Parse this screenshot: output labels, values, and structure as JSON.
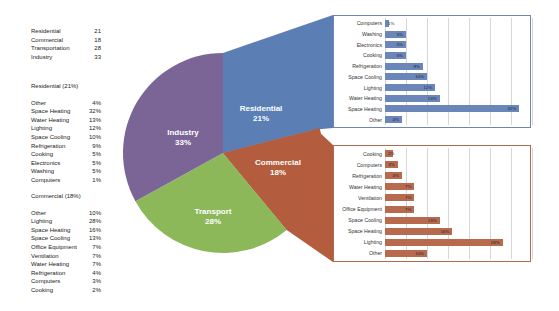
{
  "summary_table": {
    "rows": [
      {
        "label": "Residential",
        "value": "21"
      },
      {
        "label": "Commercial",
        "value": "18"
      },
      {
        "label": "Transportation",
        "value": "28"
      },
      {
        "label": "Industry",
        "value": "33"
      }
    ]
  },
  "residential_table": {
    "title": "Residential (21%)",
    "rows": [
      {
        "label": "Other",
        "value": "4%"
      },
      {
        "label": "Space Heating",
        "value": "32%"
      },
      {
        "label": "Water Heating",
        "value": "13%"
      },
      {
        "label": "Lighting",
        "value": "12%"
      },
      {
        "label": "Space Cooling",
        "value": "10%"
      },
      {
        "label": "Refrigeration",
        "value": "9%"
      },
      {
        "label": "Cooking",
        "value": "5%"
      },
      {
        "label": "Electronics",
        "value": "5%"
      },
      {
        "label": "Washing",
        "value": "5%"
      },
      {
        "label": "Computers",
        "value": "1%"
      }
    ]
  },
  "commercial_table": {
    "title": "Commercial (18%)",
    "rows": [
      {
        "label": "Other",
        "value": "10%"
      },
      {
        "label": "Lighting",
        "value": "28%"
      },
      {
        "label": "Space Heating",
        "value": "16%"
      },
      {
        "label": "Space Cooling",
        "value": "13%"
      },
      {
        "label": "Office Equipment",
        "value": "7%"
      },
      {
        "label": "Ventilation",
        "value": "7%"
      },
      {
        "label": "Water Heating",
        "value": "7%"
      },
      {
        "label": "Refrigeration",
        "value": "4%"
      },
      {
        "label": "Computers",
        "value": "3%"
      },
      {
        "label": "Cooking",
        "value": "2%"
      }
    ]
  },
  "pie_labels": {
    "residential": {
      "name": "Residential",
      "pct": "21%"
    },
    "commercial": {
      "name": "Commercial",
      "pct": "18%"
    },
    "transport": {
      "name": "Transport",
      "pct": "28%"
    },
    "industry": {
      "name": "Industry",
      "pct": "33%"
    }
  },
  "colors": {
    "residential": "#5b7fb5",
    "commercial": "#b45d3e",
    "transport": "#8db85a",
    "industry": "#7a6596",
    "residential_bar": "#6b86b8",
    "commercial_bar": "#b86a4e"
  },
  "chart_data": [
    {
      "type": "pie",
      "title": "",
      "categories": [
        "Residential",
        "Commercial",
        "Transport",
        "Industry"
      ],
      "values": [
        21,
        18,
        28,
        33
      ],
      "labels": [
        "Residential 21%",
        "Commercial 18%",
        "Transport 28%",
        "Industry 33%"
      ]
    },
    {
      "type": "bar",
      "orientation": "horizontal",
      "title": "Residential breakdown",
      "categories": [
        "Computers",
        "Washing",
        "Electronics",
        "Cooking",
        "Refrigeration",
        "Space Cooling",
        "Lighting",
        "Water Heating",
        "Space Heating",
        "Other"
      ],
      "values": [
        1,
        5,
        5,
        5,
        9,
        10,
        12,
        13,
        32,
        4
      ],
      "data_labels": [
        "1%",
        "5%",
        "5%",
        "5%",
        "9%",
        "10%",
        "12%",
        "13%",
        "32%",
        "4%"
      ],
      "xlim": [
        0,
        35
      ],
      "grid": true
    },
    {
      "type": "bar",
      "orientation": "horizontal",
      "title": "Commercial breakdown",
      "categories": [
        "Cooking",
        "Computers",
        "Refrigeration",
        "Water Heating",
        "Ventilation",
        "Office Equipment",
        "Space Cooling",
        "Space Heating",
        "Lighting",
        "Other"
      ],
      "values": [
        2,
        3,
        4,
        7,
        7,
        7,
        13,
        16,
        28,
        10
      ],
      "data_labels": [
        "2%",
        "3%",
        "4%",
        "7%",
        "7%",
        "7%",
        "13%",
        "16%",
        "28%",
        "10%"
      ],
      "xlim": [
        0,
        35
      ],
      "grid": true
    }
  ]
}
